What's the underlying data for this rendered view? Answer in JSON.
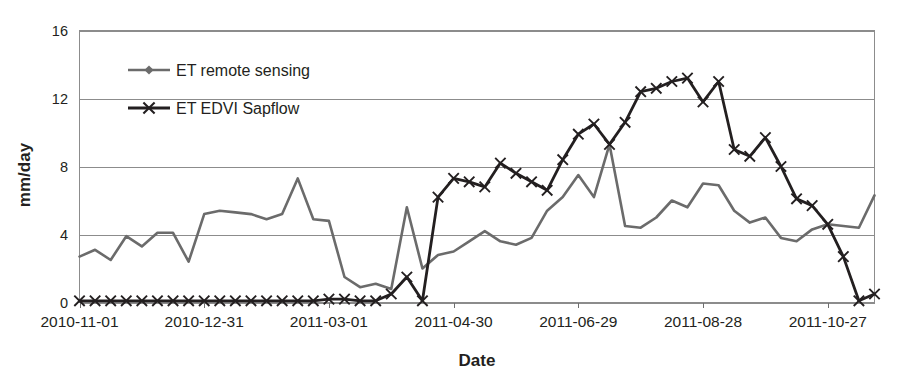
{
  "chart_data": {
    "type": "line",
    "title": "",
    "xlabel": "Date",
    "ylabel": "mm/day",
    "ylim": [
      0,
      16
    ],
    "yticks": [
      0,
      4,
      8,
      12,
      16
    ],
    "grid": true,
    "legend_position": "upper-left-inside",
    "x_tick_labels": [
      "2010-11-01",
      "2010-12-31",
      "2011-03-01",
      "2011-04-30",
      "2011-06-29",
      "2011-08-28",
      "2011-10-27"
    ],
    "x_tick_indices": [
      0,
      8,
      16,
      24,
      32,
      40,
      48
    ],
    "x_index_range": [
      0,
      51
    ],
    "x_points_note": "52 observation dates, roughly every 7-8 days from 2010-11-01 to 2011-11-10",
    "series": [
      {
        "name": "ET remote sensing",
        "marker": "diamond",
        "color": "#6b6b6b",
        "values": [
          2.7,
          3.1,
          2.5,
          3.9,
          3.3,
          4.1,
          4.1,
          2.4,
          5.2,
          5.4,
          5.3,
          5.2,
          4.9,
          5.2,
          7.3,
          4.9,
          4.8,
          1.5,
          0.9,
          1.1,
          0.8,
          5.6,
          2.0,
          2.8,
          3.0,
          3.6,
          4.2,
          3.6,
          3.4,
          3.8,
          5.4,
          6.2,
          7.5,
          6.2,
          9.3,
          4.5,
          4.4,
          5.0,
          6.0,
          5.6,
          7.0,
          6.9,
          5.4,
          4.7,
          5.0,
          3.8,
          3.6,
          4.3,
          4.6,
          4.5,
          4.4,
          6.3
        ]
      },
      {
        "name": "ET EDVI Sapflow",
        "marker": "x",
        "color": "#231f20",
        "values": [
          0.1,
          0.1,
          0.1,
          0.1,
          0.1,
          0.1,
          0.1,
          0.1,
          0.1,
          0.1,
          0.1,
          0.1,
          0.1,
          0.1,
          0.1,
          0.1,
          0.2,
          0.2,
          0.1,
          0.1,
          0.5,
          1.5,
          0.1,
          6.2,
          7.3,
          7.1,
          6.8,
          8.2,
          7.6,
          7.1,
          6.6,
          8.4,
          9.9,
          10.5,
          9.3,
          10.6,
          12.4,
          12.6,
          13.0,
          13.2,
          11.8,
          13.0,
          9.0,
          8.6,
          9.7,
          8.0,
          6.1,
          5.7,
          4.6,
          2.7,
          0.1,
          0.5
        ]
      }
    ]
  },
  "legend": {
    "items": [
      {
        "label": "ET remote sensing",
        "marker": "diamond",
        "color": "#6b6b6b"
      },
      {
        "label": "ET EDVI Sapflow",
        "marker": "x",
        "color": "#231f20"
      }
    ]
  },
  "axes": {
    "y_label": "mm/day",
    "x_label": "Date",
    "y_tick_labels": [
      "0",
      "4",
      "8",
      "12",
      "16"
    ],
    "x_tick_labels": [
      "2010-11-01",
      "2010-12-31",
      "2011-03-01",
      "2011-04-30",
      "2011-06-29",
      "2011-08-28",
      "2011-10-27"
    ]
  },
  "colors": {
    "series_remote_sensing": "#6b6b6b",
    "series_sapflow": "#231f20",
    "gridline": "#8c8c8c",
    "background": "#ffffff",
    "text": "#231f20"
  }
}
